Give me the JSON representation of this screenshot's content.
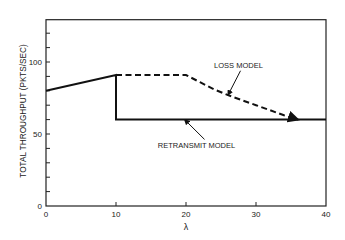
{
  "chart_data": {
    "type": "line",
    "title": "",
    "xlabel": "λ",
    "ylabel": "TOTAL THROUGHPUT (PKTS/SEC)",
    "xlim": [
      0,
      40
    ],
    "ylim": [
      0,
      130
    ],
    "x_ticks": [
      0,
      10,
      20,
      30,
      40
    ],
    "x_tick_labels": [
      "0",
      "10",
      "20",
      "30",
      "40"
    ],
    "y_major_ticks": [
      0,
      50,
      100
    ],
    "y_tick_labels": [
      "0",
      "50",
      "100"
    ],
    "y_minor_tick_step": 10,
    "grid": false,
    "series": [
      {
        "name": "LOSS MODEL",
        "style": "dashed",
        "points": [
          [
            10,
            91
          ],
          [
            20,
            91
          ],
          [
            22,
            86
          ],
          [
            24,
            81
          ],
          [
            26,
            77
          ],
          [
            28,
            73.5
          ],
          [
            30,
            70
          ],
          [
            32,
            66.5
          ],
          [
            34,
            63
          ],
          [
            36,
            60
          ]
        ]
      },
      {
        "name": "RETRANSMIT MODEL",
        "style": "solid",
        "points": [
          [
            0,
            80
          ],
          [
            10,
            91
          ],
          [
            10,
            60
          ],
          [
            40,
            60
          ]
        ]
      }
    ],
    "annotations": [
      {
        "text": "LOSS MODEL",
        "x": 27.5,
        "y": 96,
        "arrow_to": [
          26,
          77
        ]
      },
      {
        "text": "RETRANSMIT MODEL",
        "x": 21.5,
        "y": 40,
        "arrow_to": [
          19.8,
          60
        ]
      }
    ]
  },
  "colors": {
    "line": "#111111",
    "axis": "#222222",
    "background": "#ffffff"
  }
}
